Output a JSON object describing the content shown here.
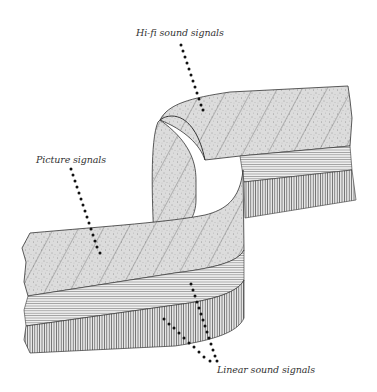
{
  "diagram": {
    "labels": {
      "hifi": "Hi-fi sound signals",
      "picture": "Picture signals",
      "linear": "Linear sound signals"
    },
    "colors": {
      "background": "#ffffff",
      "tape_surface": "#d8d8d8",
      "outline": "#333333",
      "leader_dots": "#111111",
      "label_text": "#333333"
    }
  }
}
